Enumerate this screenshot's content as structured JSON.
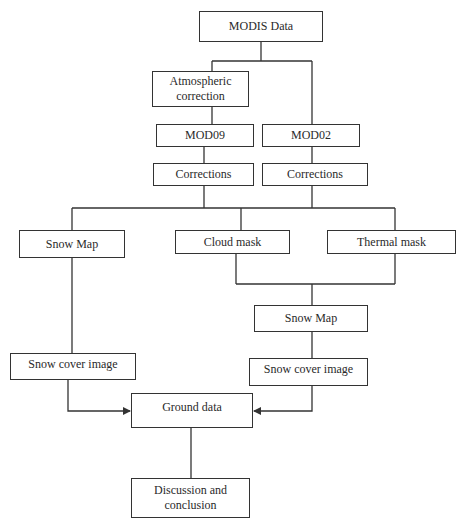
{
  "diagram": {
    "type": "flowchart",
    "nodes": {
      "modis_data": "MODIS Data",
      "atmospheric_correction": "Atmospheric\ncorrection",
      "mod09": "MOD09",
      "mod02": "MOD02",
      "corrections_left": "Corrections",
      "corrections_right": "Corrections",
      "snow_map_left": "Snow Map",
      "cloud_mask": "Cloud mask",
      "thermal_mask": "Thermal mask",
      "snow_map_right": "Snow Map",
      "snow_cover_left": "Snow cover image",
      "snow_cover_right": "Snow cover image",
      "ground_data": "Ground data",
      "discussion": "Discussion and\nconclusion"
    },
    "edges": [
      [
        "MODIS Data",
        "Atmospheric correction"
      ],
      [
        "MODIS Data",
        "MOD02"
      ],
      [
        "Atmospheric correction",
        "MOD09"
      ],
      [
        "MOD09",
        "Corrections (left)"
      ],
      [
        "MOD02",
        "Corrections (right)"
      ],
      [
        "Corrections (left)",
        "Snow Map (left)"
      ],
      [
        "Corrections (left)",
        "Cloud mask"
      ],
      [
        "Corrections (left)",
        "Thermal mask"
      ],
      [
        "Corrections (right)",
        "Snow Map (left)"
      ],
      [
        "Corrections (right)",
        "Cloud mask"
      ],
      [
        "Corrections (right)",
        "Thermal mask"
      ],
      [
        "Cloud mask",
        "Snow Map (right)"
      ],
      [
        "Thermal mask",
        "Snow Map (right)"
      ],
      [
        "Snow Map (left)",
        "Snow cover image (left)"
      ],
      [
        "Snow Map (right)",
        "Snow cover image (right)"
      ],
      [
        "Snow cover image (left)",
        "Ground data"
      ],
      [
        "Snow cover image (right)",
        "Ground data"
      ],
      [
        "Ground data",
        "Discussion and conclusion"
      ]
    ],
    "colors": {
      "stroke": "#333333",
      "text": "#2a2a2a",
      "background": "#ffffff"
    }
  }
}
